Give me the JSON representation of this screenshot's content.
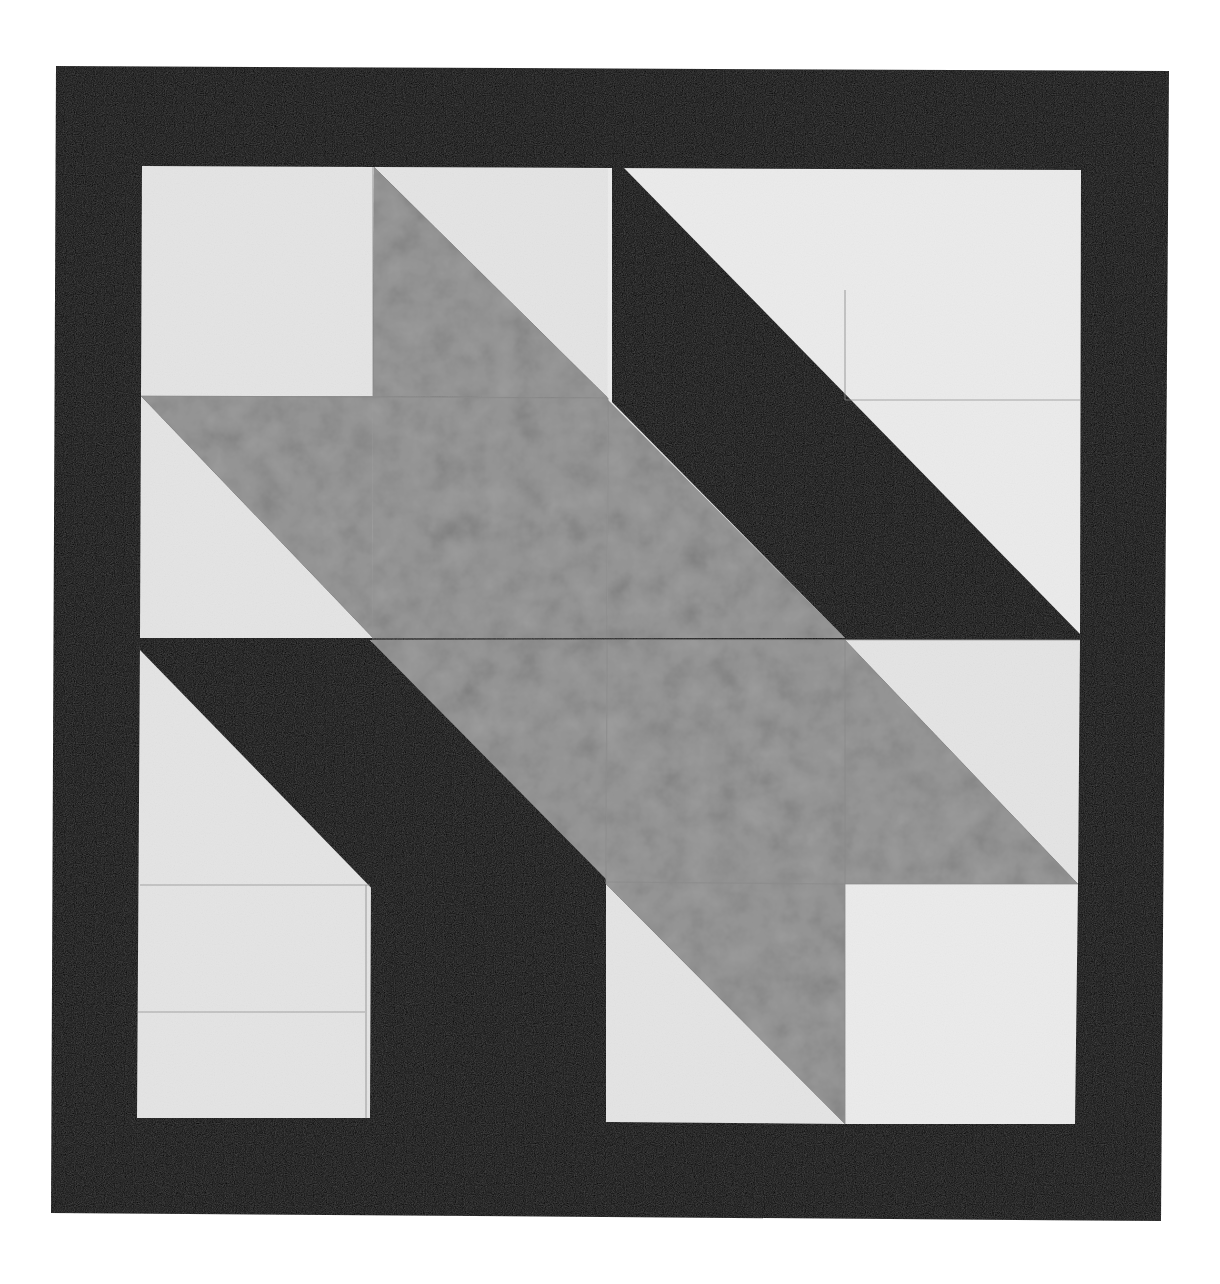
{
  "photo": {
    "subject": "quilt block",
    "background": "#ffffff",
    "colors": {
      "border": "#060606",
      "light_fabric": "#e4e4e4",
      "light_fabric_alt": "#ebebeb",
      "gray_fabric": "#9c9c9c",
      "gray_fabric_dark": "#7f7f7f",
      "dark_strip": "#060606",
      "seam": "#8a8a8a"
    },
    "outer_border": [
      [
        56,
        66
      ],
      [
        1169,
        71
      ],
      [
        1161,
        1221
      ],
      [
        51,
        1213
      ]
    ],
    "inner_block": [
      [
        142,
        166
      ],
      [
        1081,
        170
      ],
      [
        1075,
        1124
      ],
      [
        137,
        1118
      ]
    ],
    "grid": {
      "cols": [
        142,
        374,
        608,
        845,
        1079
      ],
      "rows": [
        166,
        396,
        638,
        880,
        1120
      ]
    },
    "pieces": [
      {
        "name": "light-square-r1c1",
        "fill": "light_fabric",
        "points": [
          [
            142,
            166
          ],
          [
            374,
            167
          ],
          [
            373,
            396
          ],
          [
            141,
            396
          ]
        ]
      },
      {
        "name": "light-triangle-r1c2",
        "fill": "light_fabric",
        "points": [
          [
            374,
            167
          ],
          [
            608,
            168
          ],
          [
            608,
            398
          ]
        ]
      },
      {
        "name": "gray-triangle-r1c2",
        "fill": "gray_fabric",
        "points": [
          [
            374,
            167
          ],
          [
            608,
            398
          ],
          [
            373,
            396
          ]
        ]
      },
      {
        "name": "light-bg-r1c3c4",
        "fill": "light_fabric_alt",
        "points": [
          [
            608,
            168
          ],
          [
            1081,
            170
          ],
          [
            1080,
            638
          ],
          [
            607,
            638
          ]
        ]
      },
      {
        "name": "light-triangle-r2c1",
        "fill": "light_fabric",
        "points": [
          [
            141,
            396
          ],
          [
            373,
            638
          ],
          [
            140,
            638
          ]
        ]
      },
      {
        "name": "gray-triangle-r2c1",
        "fill": "gray_fabric",
        "points": [
          [
            141,
            396
          ],
          [
            373,
            396
          ],
          [
            373,
            638
          ]
        ]
      },
      {
        "name": "gray-square-r2c2",
        "fill": "gray_fabric",
        "points": [
          [
            373,
            396
          ],
          [
            608,
            398
          ],
          [
            607,
            638
          ],
          [
            372,
            638
          ]
        ]
      },
      {
        "name": "gray-triangle-r2c3",
        "fill": "gray_fabric",
        "points": [
          [
            608,
            400
          ],
          [
            845,
            638
          ],
          [
            607,
            638
          ]
        ]
      },
      {
        "name": "dark-strip-upper",
        "fill": "dark_strip",
        "points": [
          [
            612,
            168
          ],
          [
            624,
            168
          ],
          [
            1080,
            634
          ],
          [
            1080,
            638
          ],
          [
            845,
            638
          ],
          [
            612,
            402
          ]
        ]
      },
      {
        "name": "light-bg-r3c1",
        "fill": "light_fabric",
        "points": [
          [
            140,
            640
          ],
          [
            372,
            640
          ],
          [
            370,
            1118
          ],
          [
            137,
            1118
          ]
        ]
      },
      {
        "name": "dark-strip-lower",
        "fill": "dark_strip",
        "points": [
          [
            140,
            640
          ],
          [
            370,
            640
          ],
          [
            606,
            880
          ],
          [
            606,
            1120
          ],
          [
            597,
            1120
          ],
          [
            140,
            650
          ]
        ]
      },
      {
        "name": "gray-triangle-r3c2",
        "fill": "gray_fabric",
        "points": [
          [
            370,
            640
          ],
          [
            607,
            640
          ],
          [
            607,
            880
          ]
        ]
      },
      {
        "name": "gray-square-r3c3",
        "fill": "gray_fabric",
        "points": [
          [
            607,
            640
          ],
          [
            845,
            640
          ],
          [
            845,
            884
          ],
          [
            606,
            884
          ]
        ]
      },
      {
        "name": "light-triangle-r3c4",
        "fill": "light_fabric",
        "points": [
          [
            845,
            640
          ],
          [
            1080,
            640
          ],
          [
            1078,
            884
          ]
        ]
      },
      {
        "name": "gray-triangle-r3c4",
        "fill": "gray_fabric",
        "points": [
          [
            845,
            640
          ],
          [
            1078,
            884
          ],
          [
            845,
            884
          ]
        ]
      },
      {
        "name": "light-triangle-r4c3",
        "fill": "light_fabric",
        "points": [
          [
            606,
            884
          ],
          [
            845,
            1124
          ],
          [
            606,
            1122
          ]
        ]
      },
      {
        "name": "gray-triangle-r4c3",
        "fill": "gray_fabric",
        "points": [
          [
            606,
            884
          ],
          [
            845,
            884
          ],
          [
            845,
            1124
          ]
        ]
      },
      {
        "name": "light-square-r4c4",
        "fill": "light_fabric_alt",
        "points": [
          [
            845,
            884
          ],
          [
            1078,
            884
          ],
          [
            1075,
            1124
          ],
          [
            845,
            1124
          ]
        ]
      }
    ],
    "seams": [
      [
        [
          141,
          396
        ],
        [
          608,
          398
        ]
      ],
      [
        [
          372,
          639
        ],
        [
          1080,
          640
        ]
      ],
      [
        [
          606,
          882
        ],
        [
          845,
          884
        ]
      ],
      [
        [
          845,
          884
        ],
        [
          1078,
          884
        ]
      ],
      [
        [
          373,
          167
        ],
        [
          373,
          396
        ]
      ],
      [
        [
          608,
          398
        ],
        [
          607,
          638
        ]
      ],
      [
        [
          607,
          640
        ],
        [
          606,
          884
        ]
      ],
      [
        [
          845,
          640
        ],
        [
          845,
          1124
        ]
      ],
      [
        [
          845,
          290
        ],
        [
          845,
          400
        ]
      ],
      [
        [
          845,
          400
        ],
        [
          1080,
          400
        ]
      ],
      [
        [
          140,
          885
        ],
        [
          370,
          885
        ]
      ],
      [
        [
          137,
          1012
        ],
        [
          365,
          1012
        ]
      ],
      [
        [
          366,
          885
        ],
        [
          366,
          1118
        ]
      ]
    ]
  }
}
